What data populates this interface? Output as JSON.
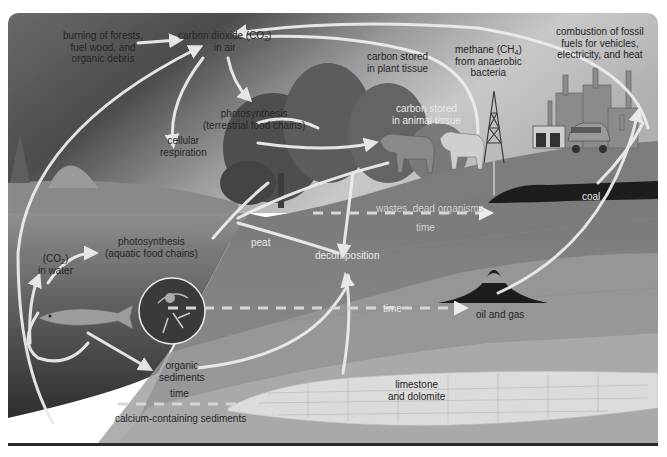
{
  "diagram": {
    "style": "grayscale illustration",
    "colors": {
      "sky_dark": "#5a5a5a",
      "sky_light": "#c8c8c8",
      "ground": "#8a8a8a",
      "water": "#4a4a4a",
      "deep_layer": "#a9a9a9",
      "limestone": "#d8d8d8",
      "arrow": "#ececec",
      "border": "#2a2a2a"
    },
    "labels": {
      "burning": "burning of forests,\nfuel wood, and\norganic debris",
      "co2_air_main": "carbon dioxide (CO",
      "co2_air_sub": "2",
      "co2_air_end": ")",
      "co2_air_line2": "in air",
      "photosynthesis_terrestrial_1": "photosynthesis",
      "photosynthesis_terrestrial_2": "(terrestrial food chains)",
      "cellular_respiration_1": "cellular",
      "cellular_respiration_2": "respiration",
      "plant_tissue_1": "carbon stored",
      "plant_tissue_2": "in plant tissue",
      "animal_tissue_1": "carbon stored",
      "animal_tissue_2": "in animal tissue",
      "methane_1_main": "methane (CH",
      "methane_1_sub": "4",
      "methane_1_end": ")",
      "methane_2": "from anaerobic",
      "methane_3": "bacteria",
      "combustion_1": "combustion of fossil",
      "combustion_2": "fuels for vehicles,",
      "combustion_3": "electricity, and heat",
      "coal": "coal",
      "wastes": "wastes, dead organisms",
      "time_upper": "time",
      "peat": "peat",
      "decomposition": "decomposition",
      "co2_water_main": "(CO",
      "co2_water_sub": "2",
      "co2_water_end": ")",
      "co2_water_line2": "in water",
      "photosynthesis_aquatic_1": "photosynthesis",
      "photosynthesis_aquatic_2": "(aquatic food chains)",
      "time_middle": "time",
      "oil_gas": "oil and gas",
      "organic_sediments_1": "organic",
      "organic_sediments_2": "sediments",
      "time_lower": "time",
      "calcium_sediments": "calcium-containing sediments",
      "limestone_1": "limestone",
      "limestone_2": "and dolomite"
    },
    "nodes": [
      "burning of forests, fuel wood, and organic debris",
      "carbon dioxide (CO2) in air",
      "photosynthesis (terrestrial food chains)",
      "cellular respiration",
      "carbon stored in plant tissue",
      "carbon stored in animal tissue",
      "methane (CH4) from anaerobic bacteria",
      "combustion of fossil fuels for vehicles, electricity, and heat",
      "coal",
      "wastes, dead organisms",
      "peat",
      "decomposition",
      "(CO2) in water",
      "photosynthesis (aquatic food chains)",
      "oil and gas",
      "organic sediments",
      "calcium-containing sediments",
      "limestone and dolomite"
    ],
    "edges": [
      {
        "from": "burning of forests",
        "to": "carbon dioxide in air"
      },
      {
        "from": "carbon dioxide in air",
        "to": "photosynthesis (terrestrial)"
      },
      {
        "from": "cellular respiration",
        "to": "carbon dioxide in air"
      },
      {
        "from": "combustion of fossil fuels",
        "to": "carbon dioxide in air"
      },
      {
        "from": "methane",
        "to": "carbon dioxide in air"
      },
      {
        "from": "photosynthesis (terrestrial)",
        "to": "carbon stored in animal tissue"
      },
      {
        "from": "carbon stored in animal tissue",
        "to": "decomposition"
      },
      {
        "from": "wastes, dead organisms",
        "to": "coal",
        "via": "time"
      },
      {
        "from": "coal",
        "to": "combustion of fossil fuels"
      },
      {
        "from": "oil and gas",
        "to": "combustion of fossil fuels"
      },
      {
        "from": "decomposition",
        "to": "oil and gas",
        "via": "time"
      },
      {
        "from": "carbon dioxide in air",
        "to": "(CO2) in water"
      },
      {
        "from": "(CO2) in water",
        "to": "photosynthesis (aquatic)"
      },
      {
        "from": "organic sediments",
        "to": "decomposition"
      },
      {
        "from": "fish",
        "to": "organic sediments"
      },
      {
        "from": "calcium-containing sediments",
        "to": "limestone and dolomite",
        "via": "time"
      }
    ]
  }
}
